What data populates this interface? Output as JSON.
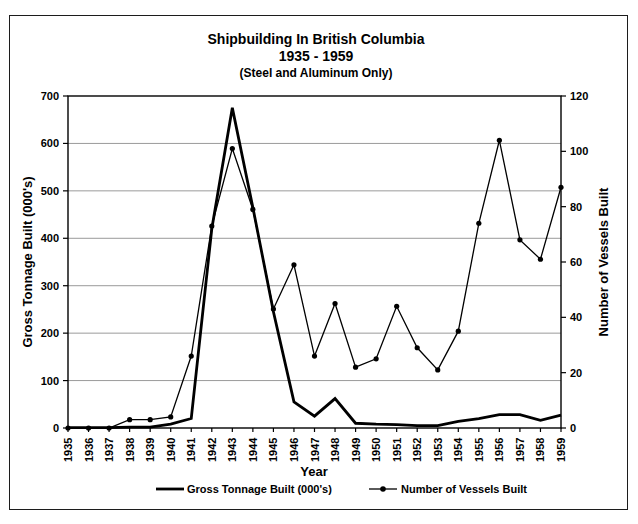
{
  "accent_color": "#000000",
  "grid_color": "#9a9a9a",
  "chart_data": {
    "type": "line",
    "title": "Shipbuilding In British Columbia",
    "subtitle": "1935 - 1959",
    "note": "(Steel and Aluminum Only)",
    "x": [
      1935,
      1936,
      1937,
      1938,
      1939,
      1940,
      1941,
      1942,
      1943,
      1944,
      1945,
      1946,
      1947,
      1948,
      1949,
      1950,
      1951,
      1952,
      1953,
      1954,
      1955,
      1956,
      1957,
      1958,
      1959
    ],
    "x_axis": {
      "label": "Year"
    },
    "left_axis": {
      "label": "Gross Tonnage Built (000's)",
      "min": 0,
      "max": 700,
      "ticks": [
        0,
        100,
        200,
        300,
        400,
        500,
        600,
        700
      ]
    },
    "right_axis": {
      "label": "Number of Vessels Built",
      "min": 0,
      "max": 120,
      "ticks": [
        0,
        20,
        40,
        60,
        80,
        100,
        120
      ]
    },
    "grid": "horizontal-only",
    "legend_position": "bottom-center",
    "series": [
      {
        "name": "Gross Tonnage Built (000's)",
        "axis": "left",
        "marker": "none",
        "color": "#000000",
        "values": [
          1,
          1,
          1,
          2,
          2,
          8,
          20,
          420,
          675,
          465,
          245,
          55,
          25,
          62,
          10,
          8,
          7,
          5,
          5,
          14,
          20,
          28,
          28,
          16,
          27
        ]
      },
      {
        "name": "Number of Vessels Built",
        "axis": "right",
        "marker": "dot",
        "color": "#000000",
        "values": [
          0,
          0,
          0,
          3,
          3,
          4,
          26,
          73,
          101,
          79,
          43,
          59,
          26,
          45,
          22,
          25,
          44,
          29,
          21,
          35,
          74,
          104,
          68,
          61,
          87
        ]
      }
    ]
  }
}
